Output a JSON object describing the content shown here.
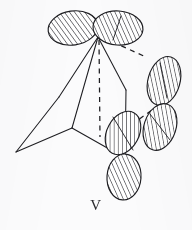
{
  "figure": {
    "label": "V",
    "caption_label": "V",
    "kind": "molecular-orbital-diagram",
    "background_color": "#fbfbfc",
    "ink_color": "#1d1d21",
    "hatch_color": "#2b2b30",
    "width": 192,
    "height": 230
  },
  "skeleton": {
    "stroke_color": "#1d1d21",
    "stroke_width": 1.05,
    "solid_bonds": [
      {
        "name": "apex-to-left-rear",
        "x1": 98,
        "y1": 37,
        "x2": 59,
        "y2": 97
      },
      {
        "name": "apex-to-mid-vertex",
        "x1": 98,
        "y1": 37,
        "x2": 72,
        "y2": 128
      },
      {
        "name": "apex-to-right-vertex",
        "x1": 98,
        "y1": 37,
        "x2": 126,
        "y2": 90
      },
      {
        "name": "left-rear-to-front-tip",
        "x1": 59,
        "y1": 97,
        "x2": 16,
        "y2": 152
      },
      {
        "name": "front-tip-to-mid-vertex",
        "x1": 16,
        "y1": 152,
        "x2": 72,
        "y2": 128
      },
      {
        "name": "mid-vertex-to-lower-right",
        "x1": 72,
        "y1": 128,
        "x2": 125,
        "y2": 158
      },
      {
        "name": "right-vertex-to-lower-right",
        "x1": 126,
        "y1": 90,
        "x2": 125,
        "y2": 158
      }
    ],
    "dashed_bonds": [
      {
        "name": "apex-vertical-dashed",
        "x1": 99,
        "y1": 40,
        "x2": 100,
        "y2": 137
      },
      {
        "name": "apex-to-upper-right-orbital-dashed",
        "x1": 104,
        "y1": 38,
        "x2": 146,
        "y2": 57
      },
      {
        "name": "inner-right-dashed",
        "x1": 124,
        "y1": 130,
        "x2": 152,
        "y2": 110
      }
    ]
  },
  "orbitals": [
    {
      "name": "orbital-top-left",
      "cx": 73,
      "cy": 28,
      "rx": 25,
      "ry": 17,
      "rotate": -8
    },
    {
      "name": "orbital-top-right",
      "cx": 118,
      "cy": 28,
      "rx": 25,
      "ry": 17,
      "rotate": 4
    },
    {
      "name": "orbital-right-upper",
      "cx": 164,
      "cy": 81,
      "rx": 16,
      "ry": 25,
      "rotate": 16
    },
    {
      "name": "orbital-right-lower",
      "cx": 160,
      "cy": 127,
      "rx": 16,
      "ry": 24,
      "rotate": 18
    },
    {
      "name": "orbital-center-lower",
      "cx": 123,
      "cy": 133,
      "rx": 16,
      "ry": 23,
      "rotate": 28
    },
    {
      "name": "orbital-bottom",
      "cx": 124,
      "cy": 177,
      "rx": 17,
      "ry": 23,
      "rotate": 4
    }
  ],
  "orbital_axes": [
    {
      "name": "axis-top-right",
      "x1": 121,
      "y1": 16,
      "x2": 113,
      "y2": 40
    },
    {
      "name": "axis-right-upper",
      "x1": 160,
      "y1": 63,
      "x2": 167,
      "y2": 98
    },
    {
      "name": "axis-right-lower",
      "x1": 150,
      "y1": 114,
      "x2": 170,
      "y2": 140
    },
    {
      "name": "axis-center-lower",
      "x1": 113,
      "y1": 117,
      "x2": 133,
      "y2": 150
    }
  ]
}
